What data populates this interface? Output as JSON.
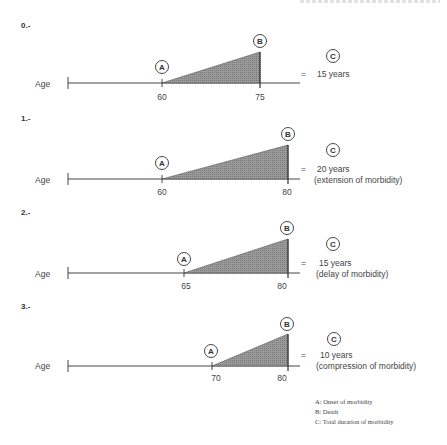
{
  "header_crop": "cropped running header text (illegible)",
  "axis_label": "Age",
  "equals_sign": "=",
  "colors": {
    "line": "#444444",
    "fill": "#8a8a8a",
    "text": "#333333"
  },
  "sections": [
    {
      "heading": "0.-",
      "onset_age": "60",
      "death_age": "75",
      "circle_a": "A",
      "circle_b": "B",
      "circle_c": "C",
      "result_line1": "15 years",
      "result_line2": ""
    },
    {
      "heading": "1.-",
      "onset_age": "60",
      "death_age": "80",
      "circle_a": "A",
      "circle_b": "B",
      "circle_c": "C",
      "result_line1": "20 years",
      "result_line2": "(extension of morbidity)"
    },
    {
      "heading": "2.-",
      "onset_age": "65",
      "death_age": "80",
      "circle_a": "A",
      "circle_b": "B",
      "circle_c": "C",
      "result_line1": "15 years",
      "result_line2": "(delay of morbidity)"
    },
    {
      "heading": "3.-",
      "onset_age": "70",
      "death_age": "80",
      "circle_a": "A",
      "circle_b": "B",
      "circle_c": "C",
      "result_line1": "10 years",
      "result_line2": "(compression of morbidity)"
    }
  ],
  "legend": [
    "A: Onset of morbidity",
    "B: Death",
    "C: Total duration of morbidity"
  ]
}
